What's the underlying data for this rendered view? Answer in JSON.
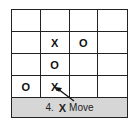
{
  "board": {
    "rows": 4,
    "cols": 4,
    "cells": [
      [
        "",
        "",
        "",
        ""
      ],
      [
        "",
        "X",
        "O",
        ""
      ],
      [
        "",
        "O",
        "",
        ""
      ],
      [
        "O",
        "X",
        "",
        ""
      ]
    ]
  },
  "caption": {
    "step": "4.",
    "player": "X",
    "action": "Move"
  },
  "arrow": {
    "from": "caption",
    "to": "cell-3-1",
    "color": "#111111"
  }
}
